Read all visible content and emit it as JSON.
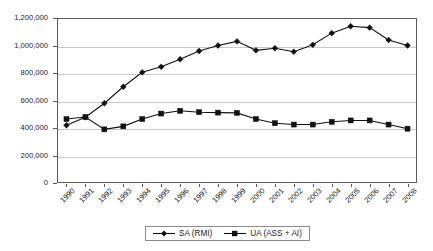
{
  "chart_data": {
    "type": "line",
    "title": "",
    "xlabel": "",
    "ylabel": "",
    "ylim": [
      0,
      1200000
    ],
    "yticks": [
      "0",
      "200,000",
      "400,000",
      "600,000",
      "800,000",
      "1,000,000",
      "1,200,000"
    ],
    "ytick_values": [
      0,
      200000,
      400000,
      600000,
      800000,
      1000000,
      1200000
    ],
    "grid": true,
    "legend_position": "bottom-center",
    "categories": [
      "1990",
      "1991",
      "1992",
      "1993",
      "1994",
      "1995",
      "1996",
      "1997",
      "1998",
      "1999",
      "2000",
      "2001",
      "2002",
      "2003",
      "2004",
      "2005",
      "2006",
      "2007",
      "2008"
    ],
    "series": [
      {
        "name": "SA (RMI)",
        "marker": "diamond",
        "color": "#111111",
        "values": [
          420000,
          478000,
          580000,
          700000,
          805000,
          845000,
          900000,
          960000,
          1000000,
          1030000,
          965000,
          980000,
          955000,
          1005000,
          1090000,
          1140000,
          1130000,
          1040000,
          1000000
        ]
      },
      {
        "name": "UA (ASS + AI)",
        "marker": "square",
        "color": "#111111",
        "values": [
          465000,
          480000,
          390000,
          412000,
          465000,
          505000,
          525000,
          515000,
          512000,
          510000,
          465000,
          435000,
          425000,
          425000,
          445000,
          455000,
          455000,
          425000,
          395000
        ]
      }
    ]
  },
  "legend": {
    "items": [
      {
        "label": "SA (RMI)",
        "marker": "diamond"
      },
      {
        "label": "UA (ASS + AI)",
        "marker": "square"
      }
    ]
  }
}
